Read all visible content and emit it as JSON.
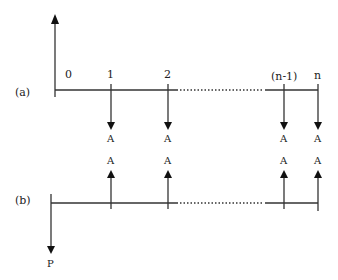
{
  "diagram": {
    "a": {
      "label": "(a)",
      "period_labels": [
        "0",
        "1",
        "2",
        "(n-1)",
        "n"
      ],
      "flow_labels": [
        "A",
        "A",
        "A",
        "A"
      ]
    },
    "b": {
      "label": "(b)",
      "flow_labels": [
        "A",
        "A",
        "A",
        "A"
      ],
      "present_label": "P"
    }
  }
}
